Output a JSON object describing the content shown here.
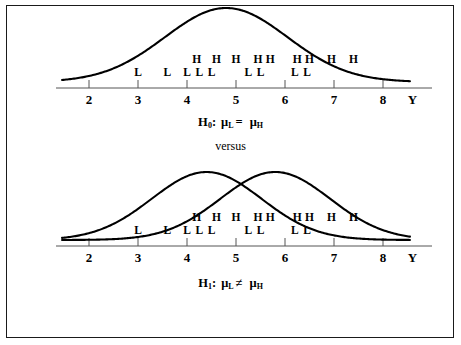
{
  "figure": {
    "background_color": "#ffffff",
    "ink_color": "#000000",
    "border_color": "#1a1a1a"
  },
  "top_panel": {
    "name": "null-hypothesis-panel",
    "axis_name": "Y",
    "tick_labels": [
      "2",
      "3",
      "4",
      "5",
      "6",
      "7",
      "8"
    ],
    "tick_values": [
      2,
      3,
      4,
      5,
      6,
      7,
      8
    ],
    "curves": [
      {
        "name": "combined-normal-curve",
        "mean": 4.8,
        "sd": 1.25,
        "peak_label": ""
      }
    ],
    "L_positions": [
      3.0,
      3.6,
      4.0,
      4.25,
      4.5,
      5.25,
      5.5,
      6.2,
      6.45
    ],
    "H_positions": [
      4.2,
      4.6,
      5.0,
      5.45,
      5.7,
      6.25,
      6.5,
      6.95,
      7.4
    ],
    "L_label": "L",
    "H_label": "H"
  },
  "top_hypothesis": {
    "name": "H",
    "subscript": "0",
    "colon": ":",
    "left_mu": "μ",
    "left_sub": "L",
    "relation": "=",
    "right_mu": "μ",
    "right_sub": "H",
    "full_text": "H0: μL = μH"
  },
  "versus": {
    "text": "versus"
  },
  "bottom_panel": {
    "name": "alternative-hypothesis-panel",
    "axis_name": "Y",
    "tick_labels": [
      "2",
      "3",
      "4",
      "5",
      "6",
      "7",
      "8"
    ],
    "tick_values": [
      2,
      3,
      4,
      5,
      6,
      7,
      8
    ],
    "curves": [
      {
        "name": "low-group-normal-curve",
        "mean": 4.4,
        "sd": 1.12,
        "peak_label": ""
      },
      {
        "name": "high-group-normal-curve",
        "mean": 5.8,
        "sd": 1.12,
        "peak_label": ""
      }
    ],
    "L_positions": [
      3.0,
      3.6,
      4.0,
      4.25,
      4.5,
      5.25,
      5.5,
      6.2,
      6.45
    ],
    "H_positions": [
      4.2,
      4.6,
      5.0,
      5.45,
      5.7,
      6.25,
      6.5,
      6.95,
      7.4
    ],
    "L_label": "L",
    "H_label": "H"
  },
  "bottom_hypothesis": {
    "name": "H",
    "subscript": "1",
    "colon": ":",
    "left_mu": "μ",
    "left_sub": "L",
    "relation": "≠",
    "right_mu": "μ",
    "right_sub": "H",
    "full_text": "H1: μL ≠ μH"
  },
  "chart_data": {
    "type": "line",
    "xlabel": "Y",
    "ylabel": "",
    "xlim": [
      1.4,
      8.6
    ],
    "grid": false,
    "legend": null,
    "panels": [
      {
        "panel": "top",
        "annotation": "H0: μL = μH",
        "series": [
          {
            "name": "combined-normal-curve",
            "distribution": "normal",
            "mean": 4.8,
            "sd": 1.25
          }
        ],
        "observations": {
          "L": [
            3.0,
            3.6,
            4.0,
            4.25,
            4.5,
            5.25,
            5.5,
            6.2,
            6.45
          ],
          "H": [
            4.2,
            4.6,
            5.0,
            5.45,
            5.7,
            6.25,
            6.5,
            6.95,
            7.4
          ]
        },
        "xticks": [
          2,
          3,
          4,
          5,
          6,
          7,
          8
        ]
      },
      {
        "panel": "bottom",
        "annotation": "H1: μL ≠ μH",
        "series": [
          {
            "name": "low-group-normal-curve",
            "distribution": "normal",
            "mean": 4.4,
            "sd": 1.12
          },
          {
            "name": "high-group-normal-curve",
            "distribution": "normal",
            "mean": 5.8,
            "sd": 1.12
          }
        ],
        "observations": {
          "L": [
            3.0,
            3.6,
            4.0,
            4.25,
            4.5,
            5.25,
            5.5,
            6.2,
            6.45
          ],
          "H": [
            4.2,
            4.6,
            5.0,
            5.45,
            5.7,
            6.25,
            6.5,
            6.95,
            7.4
          ]
        },
        "xticks": [
          2,
          3,
          4,
          5,
          6,
          7,
          8
        ]
      }
    ]
  }
}
